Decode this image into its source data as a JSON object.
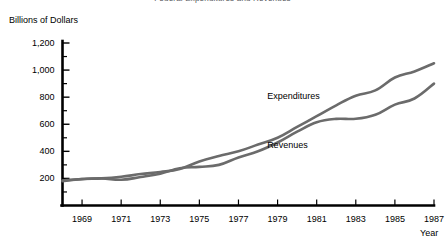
{
  "chart_data": {
    "type": "line",
    "title": "Federal Expenditures and Revenues",
    "ylabel": "Billions of Dollars",
    "xlabel": "Year",
    "xlim": [
      1968,
      1987
    ],
    "ylim": [
      0,
      1200
    ],
    "ytick_labels": [
      "200",
      "400",
      "600",
      "800",
      "1,000",
      "1,200"
    ],
    "ytick_values": [
      200,
      400,
      600,
      800,
      1000,
      1200
    ],
    "yminor_values": [
      100,
      300,
      500,
      700,
      900,
      1100
    ],
    "xtick_labels": [
      "1969",
      "1971",
      "1973",
      "1975",
      "1977",
      "1979",
      "1981",
      "1983",
      "1985",
      "1987"
    ],
    "xtick_values": [
      1969,
      1971,
      1973,
      1975,
      1977,
      1979,
      1981,
      1983,
      1985,
      1987
    ],
    "grid": false,
    "legend_position": "inline-annotation",
    "line_color": "#6b6b6b",
    "axis_color": "#000000",
    "x": [
      1968,
      1969,
      1970,
      1971,
      1972,
      1973,
      1974,
      1975,
      1976,
      1977,
      1978,
      1979,
      1980,
      1981,
      1982,
      1983,
      1984,
      1985,
      1986,
      1987
    ],
    "series": [
      {
        "name": "Expenditures",
        "label": "Expenditures",
        "values": [
          180,
          196,
          200,
          212,
          232,
          247,
          270,
          325,
          365,
          400,
          450,
          500,
          580,
          660,
          740,
          810,
          850,
          945,
          990,
          1050
        ]
      },
      {
        "name": "Revenues",
        "label": "Revenues",
        "values": [
          185,
          195,
          200,
          190,
          210,
          235,
          275,
          285,
          300,
          355,
          400,
          465,
          545,
          615,
          640,
          640,
          670,
          745,
          790,
          900
        ]
      }
    ],
    "annotations": [
      {
        "text": "Expenditures",
        "x": 1980,
        "y": 800
      },
      {
        "text": "Revenues",
        "x": 1980,
        "y": 440
      }
    ]
  }
}
